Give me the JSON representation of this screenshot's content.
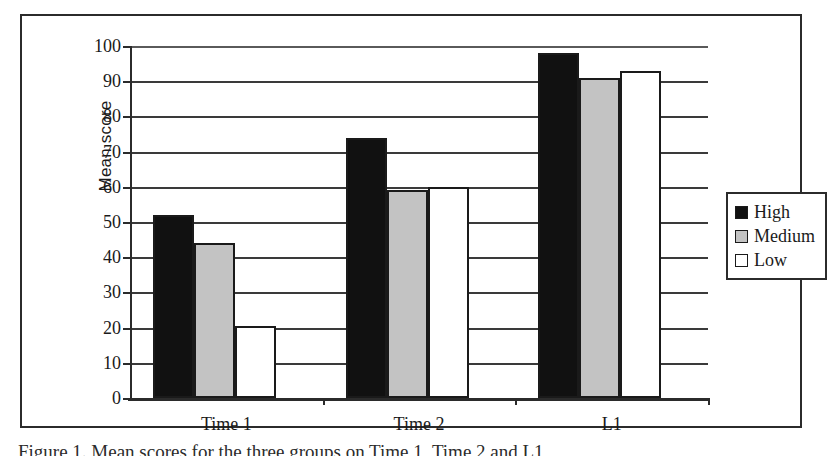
{
  "chart_data": {
    "type": "bar",
    "title": "",
    "xlabel": "",
    "ylabel": "Mean score",
    "categories": [
      "Time 1",
      "Time 2",
      "L1"
    ],
    "series": [
      {
        "name": "High",
        "color": "#111111",
        "values": [
          52,
          74,
          98
        ]
      },
      {
        "name": "Medium",
        "color": "#c3c3c3",
        "values": [
          44,
          59,
          91
        ]
      },
      {
        "name": "Low",
        "color": "#ffffff",
        "values": [
          20.5,
          60,
          93
        ]
      }
    ],
    "ylim": [
      0,
      100
    ],
    "ytick_step": 10,
    "yticks": [
      0,
      10,
      20,
      30,
      40,
      50,
      60,
      70,
      80,
      90,
      100
    ],
    "ytick_labels": [
      "0",
      "10",
      "20",
      "30",
      "40",
      "50",
      "60",
      "70",
      "80",
      "90",
      "100"
    ],
    "grid": true,
    "grid_axis": "y",
    "legend_position": "right",
    "legend_entries": [
      "High",
      "Medium",
      "Low"
    ]
  },
  "caption": {
    "text": "Figure 1. Mean scores for the three groups on Time 1, Time 2 and L1"
  }
}
